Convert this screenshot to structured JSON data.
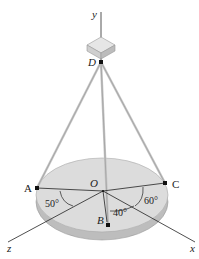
{
  "diagram": {
    "type": "3D statics figure: plate suspended by three cables from point D",
    "axes": {
      "x": "x",
      "y": "y",
      "z": "z"
    },
    "points": {
      "A": "A",
      "B": "B",
      "C": "C",
      "D": "D",
      "O": "O"
    },
    "angles": {
      "a1": "50°",
      "a2": "40°",
      "a3": "60°"
    },
    "colors": {
      "plate_top": "#dcdcdc",
      "plate_edge": "#bdbdbd",
      "cable": "#c8c8c8",
      "line": "#222222"
    }
  }
}
